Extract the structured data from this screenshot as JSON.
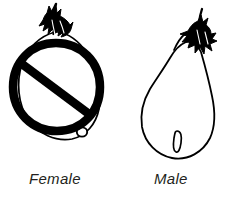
{
  "diagram": {
    "background_color": "#ffffff",
    "ink_color": "#000000",
    "caption_color": "#231f20",
    "items": [
      {
        "id": "female",
        "label": "Female",
        "icon": "eggplant-round-icon",
        "prohibited": true,
        "prohibition_icon": "no-entry-slash-icon",
        "blossom_scar": "round",
        "fruit_shape": "round-squat",
        "calyx": "spiky-crown",
        "fill": "#ffffff",
        "stroke": "#000000"
      },
      {
        "id": "male",
        "label": "Male",
        "icon": "eggplant-pear-icon",
        "prohibited": false,
        "prohibition_icon": "",
        "blossom_scar": "oval-slit",
        "fruit_shape": "pear-elongated",
        "calyx": "spiky-star",
        "fill": "#ffffff",
        "stroke": "#000000"
      }
    ]
  }
}
